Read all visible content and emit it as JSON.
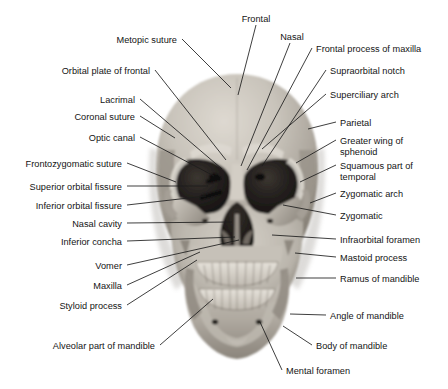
{
  "figure": {
    "orientation": "anterior",
    "image_kind": "grayscale photograph of a dry skull with leader-line labels"
  },
  "colors": {
    "background": "#ffffff",
    "label_text": "#141414",
    "leader_line": "#1c1c1c",
    "bone_light": "#d8d4cd",
    "bone_mid": "#b3aea6",
    "bone_shadow": "#8d877e",
    "bone_dark": "#5e5850",
    "cavity_dark": "#2a2622",
    "cavity_black": "#15120f"
  },
  "labels": {
    "top": [
      {
        "id": "frontal",
        "text": "Frontal",
        "x": 256,
        "y": 14,
        "anchor": "center",
        "line": [
          [
            256,
            25
          ],
          [
            238,
            95
          ]
        ]
      },
      {
        "id": "nasal",
        "text": "Nasal",
        "x": 292,
        "y": 32,
        "anchor": "center",
        "line": [
          [
            290,
            43
          ],
          [
            241,
            166
          ]
        ]
      }
    ],
    "left": [
      {
        "id": "metopic-suture",
        "text": "Metopic suture",
        "x": 177,
        "y": 35,
        "anchor": "right",
        "line": [
          [
            182,
            39
          ],
          [
            231,
            88
          ]
        ]
      },
      {
        "id": "orbital-plate-of-frontal",
        "text": "Orbital plate of frontal",
        "x": 150,
        "y": 66,
        "anchor": "right",
        "line": [
          [
            155,
            70
          ],
          [
            226,
            160
          ]
        ]
      },
      {
        "id": "lacrimal",
        "text": "Lacrimal",
        "x": 135,
        "y": 95,
        "anchor": "right",
        "line": [
          [
            140,
            99
          ],
          [
            222,
            169
          ]
        ]
      },
      {
        "id": "coronal-suture",
        "text": "Coronal suture",
        "x": 135,
        "y": 112,
        "anchor": "right",
        "line": [
          [
            140,
            116
          ],
          [
            175,
            138
          ]
        ]
      },
      {
        "id": "optic-canal",
        "text": "Optic canal",
        "x": 135,
        "y": 133,
        "anchor": "right",
        "line": [
          [
            140,
            137
          ],
          [
            214,
            176
          ]
        ]
      },
      {
        "id": "frontozygomatic-suture",
        "text": "Frontozygomatic suture",
        "x": 122,
        "y": 159,
        "anchor": "right",
        "line": [
          [
            127,
            163
          ],
          [
            176,
            182
          ]
        ]
      },
      {
        "id": "superior-orbital-fissure",
        "text": "Superior orbital fissure",
        "x": 122,
        "y": 182,
        "anchor": "right",
        "line": [
          [
            127,
            186
          ],
          [
            208,
            186
          ]
        ]
      },
      {
        "id": "inferior-orbital-fissure",
        "text": "Inferior orbital fissure",
        "x": 122,
        "y": 201,
        "anchor": "right",
        "line": [
          [
            127,
            205
          ],
          [
            206,
            196
          ]
        ]
      },
      {
        "id": "nasal-cavity",
        "text": "Nasal cavity",
        "x": 122,
        "y": 219,
        "anchor": "right",
        "line": [
          [
            127,
            223
          ],
          [
            232,
            222
          ]
        ]
      },
      {
        "id": "inferior-concha",
        "text": "Inferior concha",
        "x": 122,
        "y": 237,
        "anchor": "right",
        "line": [
          [
            127,
            241
          ],
          [
            235,
            237
          ]
        ]
      },
      {
        "id": "vomer",
        "text": "Vomer",
        "x": 122,
        "y": 261,
        "anchor": "right",
        "line": [
          [
            127,
            265
          ],
          [
            239,
            240
          ]
        ]
      },
      {
        "id": "maxilla",
        "text": "Maxilla",
        "x": 122,
        "y": 281,
        "anchor": "right",
        "line": [
          [
            127,
            285
          ],
          [
            200,
            252
          ]
        ]
      },
      {
        "id": "styloid-process",
        "text": "Styloid process",
        "x": 122,
        "y": 301,
        "anchor": "right",
        "line": [
          [
            127,
            305
          ],
          [
            197,
            260
          ]
        ]
      },
      {
        "id": "alveolar-part-of-mandible",
        "text": "Alveolar part of mandible",
        "x": 155,
        "y": 341,
        "anchor": "right",
        "line": [
          [
            160,
            345
          ],
          [
            213,
            299
          ]
        ]
      }
    ],
    "right": [
      {
        "id": "frontal-process-of-maxilla",
        "text": "Frontal process of maxilla",
        "x": 316,
        "y": 44,
        "anchor": "left",
        "line": [
          [
            312,
            48
          ],
          [
            247,
            170
          ]
        ]
      },
      {
        "id": "supraorbital-notch",
        "text": "Supraorbital notch",
        "x": 330,
        "y": 66,
        "anchor": "left",
        "line": [
          [
            326,
            70
          ],
          [
            262,
            166
          ]
        ]
      },
      {
        "id": "superciliary-arch",
        "text": "Superciliary arch",
        "x": 330,
        "y": 90,
        "anchor": "left",
        "line": [
          [
            326,
            94
          ],
          [
            262,
            149
          ]
        ]
      },
      {
        "id": "parietal",
        "text": "Parietal",
        "x": 340,
        "y": 118,
        "anchor": "left",
        "line": [
          [
            336,
            122
          ],
          [
            308,
            129
          ]
        ]
      },
      {
        "id": "greater-wing-of-sphenoid",
        "text": "Greater wing of\nsphenoid",
        "x": 340,
        "y": 136,
        "anchor": "left",
        "line": [
          [
            336,
            140
          ],
          [
            296,
            163
          ]
        ]
      },
      {
        "id": "squamous-part-of-temporal",
        "text": "Squamous part of\ntemporal",
        "x": 340,
        "y": 161,
        "anchor": "left",
        "line": [
          [
            336,
            165
          ],
          [
            300,
            182
          ]
        ]
      },
      {
        "id": "zygomatic-arch",
        "text": "Zygomatic arch",
        "x": 340,
        "y": 189,
        "anchor": "left",
        "line": [
          [
            336,
            193
          ],
          [
            310,
            203
          ]
        ]
      },
      {
        "id": "zygomatic",
        "text": "Zygomatic",
        "x": 340,
        "y": 211,
        "anchor": "left",
        "line": [
          [
            336,
            215
          ],
          [
            283,
            205
          ]
        ]
      },
      {
        "id": "infraorbital-foramen",
        "text": "Infraorbital foramen",
        "x": 340,
        "y": 235,
        "anchor": "left",
        "line": [
          [
            336,
            239
          ],
          [
            272,
            235
          ]
        ]
      },
      {
        "id": "mastoid-process",
        "text": "Mastoid process",
        "x": 340,
        "y": 253,
        "anchor": "left",
        "line": [
          [
            336,
            257
          ],
          [
            295,
            253
          ]
        ]
      },
      {
        "id": "ramus-of-mandible",
        "text": "Ramus of mandible",
        "x": 340,
        "y": 274,
        "anchor": "left",
        "line": [
          [
            336,
            278
          ],
          [
            296,
            278
          ]
        ]
      },
      {
        "id": "angle-of-mandible",
        "text": "Angle of mandible",
        "x": 330,
        "y": 311,
        "anchor": "left",
        "line": [
          [
            326,
            315
          ],
          [
            290,
            314
          ]
        ]
      },
      {
        "id": "body-of-mandible",
        "text": "Body of mandible",
        "x": 316,
        "y": 341,
        "anchor": "left",
        "line": [
          [
            312,
            345
          ],
          [
            283,
            326
          ]
        ]
      },
      {
        "id": "mental-foramen",
        "text": "Mental foramen",
        "x": 286,
        "y": 366,
        "anchor": "left",
        "line": [
          [
            282,
            370
          ],
          [
            260,
            322
          ]
        ]
      }
    ]
  }
}
